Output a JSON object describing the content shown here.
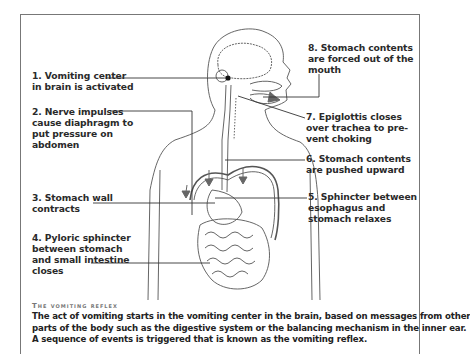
{
  "diagram": {
    "title": "The vomiting reflex",
    "labels": [
      {
        "id": "1",
        "lines": [
          "1. Vomiting center",
          "in brain is activated"
        ]
      },
      {
        "id": "2",
        "lines": [
          "2. Nerve impulses",
          "cause diaphragm to",
          "put pressure on",
          "abdomen"
        ]
      },
      {
        "id": "3",
        "lines": [
          "3. Stomach wall",
          "contracts"
        ]
      },
      {
        "id": "4",
        "lines": [
          "4. Pyloric sphincter",
          "between stomach",
          "and small intestine",
          "closes"
        ]
      },
      {
        "id": "5",
        "lines": [
          "5. Sphincter between",
          "esophagus and",
          "stomach relaxes"
        ]
      },
      {
        "id": "6",
        "lines": [
          "6. Stomach contents",
          "are pushed upward"
        ]
      },
      {
        "id": "7",
        "lines": [
          "7. Epiglottis closes",
          "over trachea to pre-",
          "vent choking"
        ]
      },
      {
        "id": "8",
        "lines": [
          "8. Stomach contents",
          "are forced out of the",
          "mouth"
        ]
      }
    ],
    "caption": {
      "heading": "The vomiting reflex",
      "lines": [
        "The act of vomiting starts in the vomiting center in the brain, based on messages from other",
        "parts of the body such as the digestive system or the balancing mechanism in the inner ear.",
        "A sequence of events is triggered that is known as the vomiting reflex."
      ]
    },
    "colors": {
      "frame": "#777777",
      "line": "#333333",
      "arrow": "#666666",
      "caption_heading": "#777777"
    }
  }
}
